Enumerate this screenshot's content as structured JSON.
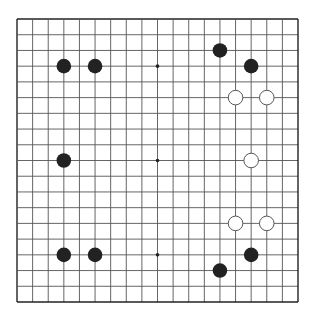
{
  "board": {
    "size": 19,
    "origin": [
      17,
      19
    ],
    "end": [
      298,
      302
    ],
    "background": "#ffffff",
    "line_color": "#555555",
    "border_color": "#222222",
    "star_points": [
      [
        9,
        3
      ],
      [
        9,
        9
      ],
      [
        9,
        15
      ],
      [
        3,
        3
      ],
      [
        15,
        3
      ],
      [
        3,
        9
      ],
      [
        15,
        9
      ],
      [
        3,
        15
      ],
      [
        15,
        15
      ]
    ],
    "stones": [
      {
        "color": "black",
        "col": 3,
        "row": 3
      },
      {
        "color": "black",
        "col": 5,
        "row": 3
      },
      {
        "color": "black",
        "col": 13,
        "row": 2
      },
      {
        "color": "black",
        "col": 15,
        "row": 3
      },
      {
        "color": "white",
        "col": 14,
        "row": 5
      },
      {
        "color": "white",
        "col": 16,
        "row": 5
      },
      {
        "color": "black",
        "col": 3,
        "row": 9
      },
      {
        "color": "white",
        "col": 15,
        "row": 9
      },
      {
        "color": "white",
        "col": 14,
        "row": 13
      },
      {
        "color": "white",
        "col": 16,
        "row": 13
      },
      {
        "color": "black",
        "col": 3,
        "row": 15
      },
      {
        "color": "black",
        "col": 5,
        "row": 15
      },
      {
        "color": "black",
        "col": 15,
        "row": 15
      },
      {
        "color": "black",
        "col": 13,
        "row": 16
      }
    ],
    "stone_colors": {
      "black": "#222222",
      "white": "#ffffff",
      "white_outline": "#444444"
    }
  }
}
